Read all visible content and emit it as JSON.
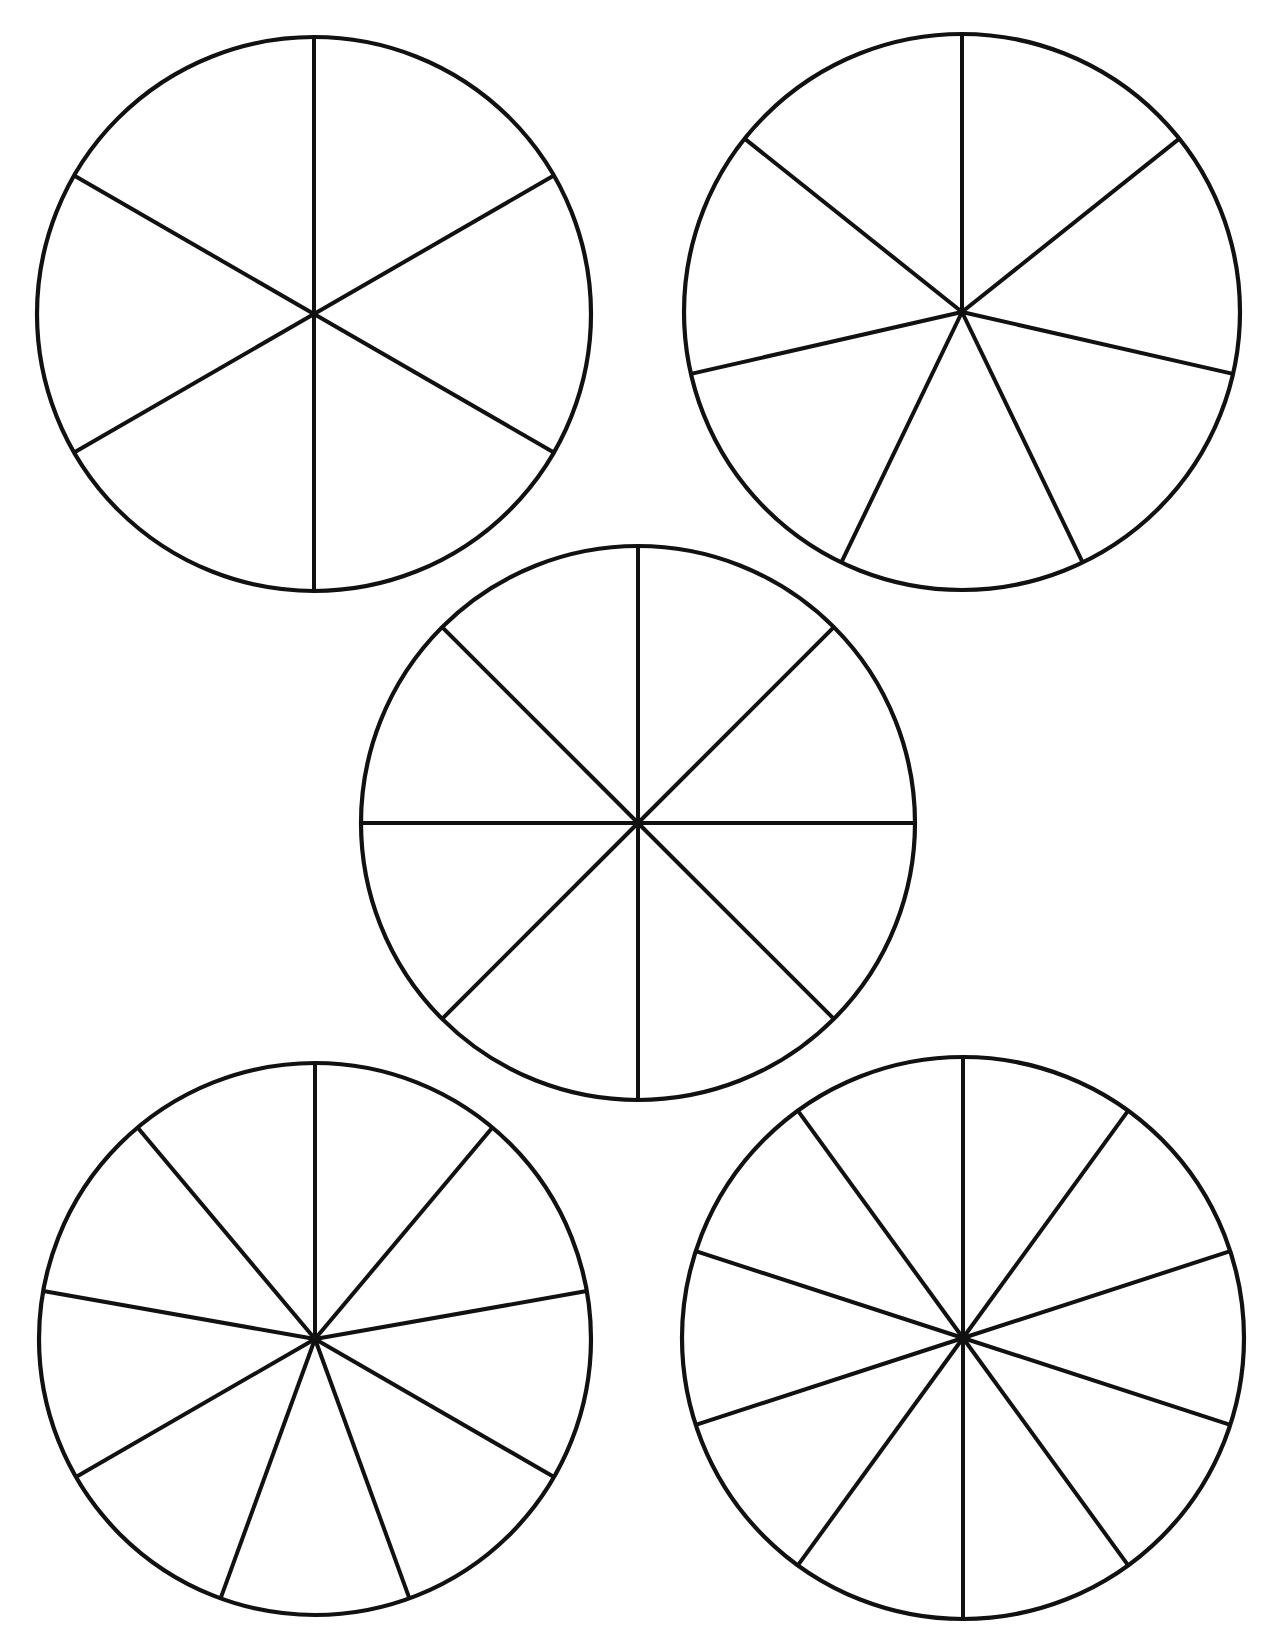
{
  "page": {
    "title": "",
    "background": "#ffffff",
    "line_color": "#111111",
    "width": 1271,
    "height": 1632
  },
  "circles": [
    {
      "id": "circle-sixths",
      "sectors": 6,
      "cx": 314,
      "cy": 314,
      "r": 277,
      "rotation_deg": 0
    },
    {
      "id": "circle-sevenths",
      "sectors": 7,
      "cx": 962,
      "cy": 312,
      "r": 278,
      "rotation_deg": 0
    },
    {
      "id": "circle-eighths",
      "sectors": 8,
      "cx": 638,
      "cy": 823,
      "r": 277,
      "rotation_deg": 0
    },
    {
      "id": "circle-ninths",
      "sectors": 9,
      "cx": 315,
      "cy": 1339,
      "r": 276,
      "rotation_deg": 0
    },
    {
      "id": "circle-tenths",
      "sectors": 10,
      "cx": 963,
      "cy": 1338,
      "r": 281,
      "rotation_deg": 0
    }
  ],
  "chart_data": {
    "type": "pie",
    "title": "",
    "charts": [
      {
        "sectors": 6,
        "values": [
          1,
          1,
          1,
          1,
          1,
          1
        ]
      },
      {
        "sectors": 7,
        "values": [
          1,
          1,
          1,
          1,
          1,
          1,
          1
        ]
      },
      {
        "sectors": 8,
        "values": [
          1,
          1,
          1,
          1,
          1,
          1,
          1,
          1
        ]
      },
      {
        "sectors": 9,
        "values": [
          1,
          1,
          1,
          1,
          1,
          1,
          1,
          1,
          1
        ]
      },
      {
        "sectors": 10,
        "values": [
          1,
          1,
          1,
          1,
          1,
          1,
          1,
          1,
          1,
          1
        ]
      }
    ],
    "labels": [],
    "legend": null
  }
}
